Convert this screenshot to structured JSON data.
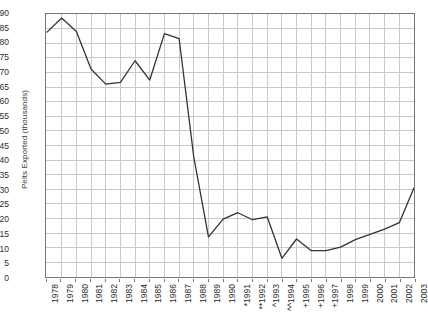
{
  "chart_data": {
    "type": "line",
    "title": "",
    "xlabel": "",
    "ylabel": "Pelts Exported (thousands)",
    "ylim": [
      0,
      90
    ],
    "ytick_step": 5,
    "grid": true,
    "legend": "none",
    "series_color": "#333333",
    "grid_color": "#c9c9c9",
    "frame_color": "#777777",
    "categories": [
      "1978",
      "1979",
      "1980",
      "1981",
      "1982",
      "1983",
      "1984",
      "1985",
      "1986",
      "1987",
      "1988",
      "1989",
      "1990",
      "*1991",
      "**1992",
      "^1993",
      "^^1994",
      "+1995",
      "+1996",
      "+1997",
      "1998",
      "1999",
      "2000",
      "2001",
      "2002",
      "2003"
    ],
    "years": [
      1978,
      1979,
      1980,
      1981,
      1982,
      1983,
      1984,
      1985,
      1986,
      1987,
      1988,
      1989,
      1990,
      1991,
      1992,
      1993,
      1994,
      1995,
      1996,
      1997,
      1998,
      1999,
      2000,
      2001,
      2002,
      2003
    ],
    "values": [
      83.8,
      88.6,
      84.0,
      71.2,
      66.0,
      66.6,
      74.0,
      67.4,
      83.3,
      81.6,
      41.0,
      13.7,
      19.8,
      22.0,
      19.6,
      20.6,
      6.4,
      13.0,
      9.0,
      9.0,
      10.2,
      12.8,
      14.6,
      16.4,
      18.6,
      30.5
    ],
    "yticks": [
      0,
      5,
      10,
      15,
      20,
      25,
      30,
      35,
      40,
      45,
      50,
      55,
      60,
      65,
      70,
      75,
      80,
      85,
      90
    ],
    "footnote_markers": {
      "*": "1991",
      "**": "1992",
      "^": "1993",
      "^^": "1994",
      "+": "1995, 1996, 1997"
    }
  }
}
